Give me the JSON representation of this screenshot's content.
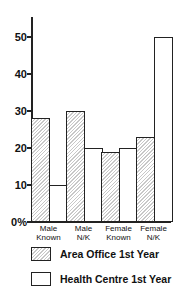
{
  "chart_data": {
    "type": "bar",
    "title": "",
    "xlabel": "",
    "ylabel": "%",
    "ylim": [
      0,
      55
    ],
    "yticks": [
      "0%",
      "10",
      "20",
      "30",
      "40",
      "50"
    ],
    "categories": [
      "Male Known",
      "Male N/K",
      "Female Known",
      "Female N/K"
    ],
    "category_lines": [
      [
        "Male",
        "Known"
      ],
      [
        "Male",
        "N/K"
      ],
      [
        "Female",
        "Known"
      ],
      [
        "Female",
        "N/K"
      ]
    ],
    "series": [
      {
        "name": "Area Office 1st Year",
        "pattern": "hatched",
        "values": [
          28,
          30,
          19,
          23
        ]
      },
      {
        "name": "Health Centre 1st Year",
        "pattern": "plain",
        "values": [
          10,
          20,
          20,
          50
        ]
      }
    ],
    "legend_position": "bottom",
    "grid": false
  },
  "legend": {
    "area_office": "Area Office 1st Year",
    "health_centre": "Health Centre 1st Year"
  }
}
